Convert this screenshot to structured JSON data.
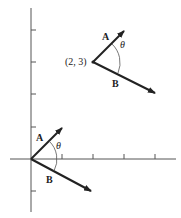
{
  "diagram": {
    "axes": {
      "x_ticks": [
        1,
        2,
        3,
        4
      ],
      "y_ticks": [
        -1,
        1,
        2,
        3,
        4
      ]
    },
    "origin_pair": {
      "vector_a_label": "A",
      "vector_b_label": "B",
      "angle_label": "θ"
    },
    "translated_pair": {
      "point_label": "(2, 3)",
      "vector_a_label": "A",
      "vector_b_label": "B",
      "angle_label": "θ"
    },
    "colors": {
      "line": "#222222",
      "axis": "#555555",
      "background": "#ffffff"
    }
  }
}
